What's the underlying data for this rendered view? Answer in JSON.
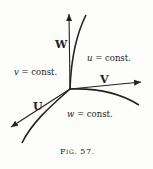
{
  "figure": {
    "caption": "Fig. 57.",
    "vectors": {
      "W": "W",
      "V": "V",
      "U": "U"
    },
    "surfaces": {
      "u": {
        "var": "u",
        "rest": " = const."
      },
      "v": {
        "var": "v",
        "rest": " = const."
      },
      "w": {
        "var": "w",
        "rest": " = const."
      }
    },
    "colors": {
      "ink": "#222222",
      "paper": "#fdfdfb"
    }
  }
}
